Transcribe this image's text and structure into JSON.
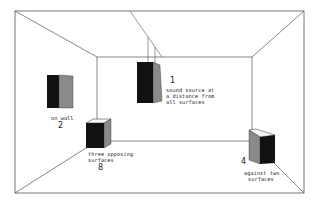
{
  "diagram": {
    "colors": {
      "line": "#555555",
      "speaker_front": "#111111",
      "speaker_side": "#8a8a8a",
      "speaker_top": "#f4f4f4",
      "text": "#222222"
    },
    "positions": [
      {
        "id": "source-1",
        "number": "1",
        "label_lines": [
          "sound source at",
          "a distance from",
          "all surfaces"
        ],
        "placement": "hanging from ceiling"
      },
      {
        "id": "source-2",
        "number": "2",
        "label_lines": [
          "on wall"
        ],
        "placement": "left wall"
      },
      {
        "id": "source-8",
        "number": "8",
        "label_lines": [
          "three opposing",
          "surfaces"
        ],
        "placement": "left rear floor corner"
      },
      {
        "id": "source-4",
        "number": "4",
        "label_lines": [
          "against two",
          "surfaces"
        ],
        "placement": "right rear floor edge"
      }
    ]
  }
}
